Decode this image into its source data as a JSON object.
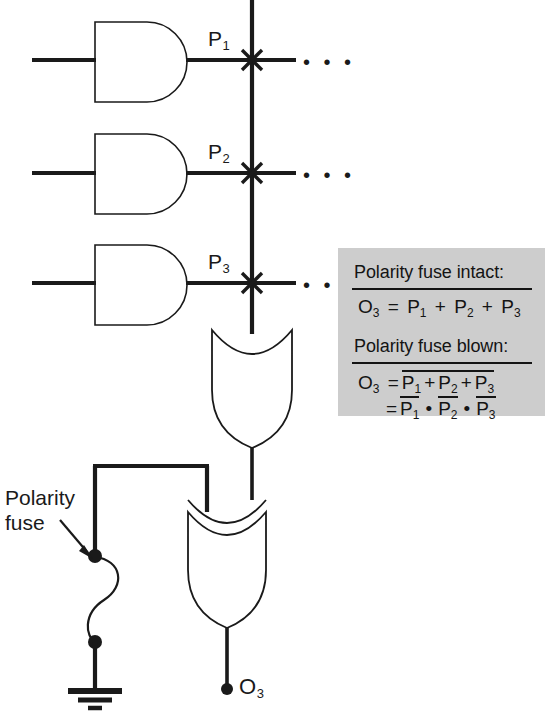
{
  "diagram": {
    "colors": {
      "line": "#1a1a1a",
      "panel_background": "#cdcdcd",
      "text": "#141414",
      "page_background": "#ffffff"
    },
    "product_terms": [
      {
        "id": "P1",
        "label": "P",
        "subscript": "1",
        "gate": "and-gate",
        "row_y": 60
      },
      {
        "id": "P2",
        "label": "P",
        "subscript": "2",
        "gate": "and-gate",
        "row_y": 173
      },
      {
        "id": "P3",
        "label": "P",
        "subscript": "3",
        "gate": "and-gate",
        "row_y": 283
      }
    ],
    "continuation_dots": "• • •",
    "gates": [
      {
        "name": "and-gate-1",
        "type": "AND",
        "output": "P1"
      },
      {
        "name": "and-gate-2",
        "type": "AND",
        "output": "P2"
      },
      {
        "name": "and-gate-3",
        "type": "AND",
        "output": "P3"
      },
      {
        "name": "or-gate",
        "type": "OR",
        "output": "sum-of-products"
      },
      {
        "name": "xor-gate",
        "type": "XOR",
        "output": "O3"
      }
    ],
    "fuse": {
      "label_line1": "Polarity",
      "label_line2": "fuse",
      "name": "polarity-fuse"
    },
    "output": {
      "label": "O",
      "subscript": "3",
      "name": "output-O3"
    },
    "ground": {
      "name": "ground-symbol"
    }
  },
  "formula_panel": {
    "name": "formula-panel",
    "intact": {
      "heading": "Polarity fuse intact:",
      "equation": {
        "lhs": "O",
        "lhs_sub": "3",
        "eq": "=",
        "terms": [
          {
            "label": "P",
            "sub": "1",
            "overline": false
          },
          {
            "label": "P",
            "sub": "2",
            "overline": false
          },
          {
            "label": "P",
            "sub": "3",
            "overline": false
          }
        ],
        "operator": "+"
      }
    },
    "blown": {
      "heading": "Polarity fuse blown:",
      "equation_line1": {
        "lhs": "O",
        "lhs_sub": "3",
        "eq": "=",
        "terms": [
          {
            "label": "P",
            "sub": "1"
          },
          {
            "label": "P",
            "sub": "2"
          },
          {
            "label": "P",
            "sub": "3"
          }
        ],
        "operator": "+",
        "group_overline": true
      },
      "equation_line2": {
        "eq": "=",
        "terms": [
          {
            "label": "P",
            "sub": "1",
            "overline": true
          },
          {
            "label": "P",
            "sub": "2",
            "overline": true
          },
          {
            "label": "P",
            "sub": "3",
            "overline": true
          }
        ],
        "operator": "•"
      }
    }
  }
}
